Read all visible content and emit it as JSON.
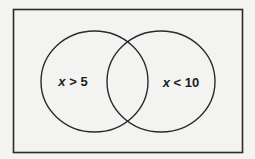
{
  "diagram": {
    "type": "venn",
    "colors": {
      "background": "#f3f3f1",
      "stroke": "#2a2a2a",
      "text": "#1c1c1c"
    },
    "universe": {
      "shape": "rectangle"
    },
    "sets": [
      {
        "id": "left",
        "variable": "x",
        "operator": ">",
        "value": "5",
        "label": "x > 5"
      },
      {
        "id": "right",
        "variable": "x",
        "operator": "<",
        "value": "10",
        "label": "x < 10"
      }
    ]
  }
}
